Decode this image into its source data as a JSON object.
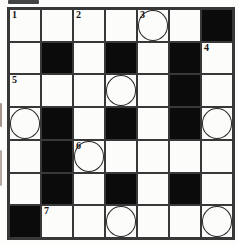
{
  "puzzle": {
    "type": "crossword",
    "rows": 7,
    "cols": 7,
    "clue_numbers_visible": [
      "1",
      "2",
      "3",
      "4",
      "5",
      "6",
      "7"
    ],
    "grid": [
      [
        {
          "number": "1"
        },
        {},
        {
          "number": "2"
        },
        {},
        {
          "number": "3",
          "circle": true
        },
        {},
        {
          "black": true
        }
      ],
      [
        {},
        {
          "black": true
        },
        {},
        {
          "black": true
        },
        {},
        {
          "black": true
        },
        {
          "number": "4"
        }
      ],
      [
        {
          "number": "5"
        },
        {},
        {},
        {
          "circle": true
        },
        {},
        {
          "black": true
        },
        {}
      ],
      [
        {
          "circle": true
        },
        {
          "black": true
        },
        {},
        {
          "black": true
        },
        {},
        {
          "black": true
        },
        {
          "circle": true
        }
      ],
      [
        {},
        {
          "black": true
        },
        {
          "number": "6",
          "circle": true
        },
        {},
        {},
        {},
        {}
      ],
      [
        {},
        {
          "black": true
        },
        {},
        {
          "black": true
        },
        {},
        {
          "black": true
        },
        {}
      ],
      [
        {
          "black": true
        },
        {
          "number": "7"
        },
        {},
        {
          "circle": true
        },
        {},
        {},
        {
          "circle": true
        }
      ]
    ],
    "colors": {
      "background": "#fdfdfc",
      "cell_fill": "#fcfcfa",
      "black_square": "#0b0b0b",
      "grid_line": "#383838",
      "circle_stroke": "#262626",
      "number_color": "#161616"
    }
  }
}
